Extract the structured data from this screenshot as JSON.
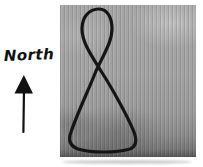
{
  "figure": {
    "north_label": "North",
    "arrow_color": "#111111",
    "curve_color": "#151515",
    "photo_base_color": "#a3a3a3",
    "background_color": "#ffffff"
  }
}
